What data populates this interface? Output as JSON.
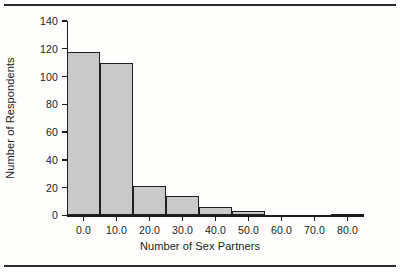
{
  "chart_data": {
    "type": "bar",
    "title": "",
    "xlabel": "Number of Sex Partners",
    "ylabel": "Number of Respondents",
    "categories": [
      "0.0",
      "10.0",
      "20.0",
      "30.0",
      "40.0",
      "50.0",
      "60.0",
      "70.0",
      "80.0"
    ],
    "values": [
      118,
      110,
      21,
      14,
      6,
      3,
      0,
      0,
      1
    ],
    "xtick_labels": [
      "0.0",
      "10.0",
      "20.0",
      "30.0",
      "40.0",
      "50.0",
      "60.0",
      "70.0",
      "80.0"
    ],
    "xtick_values": [
      0,
      10,
      20,
      30,
      40,
      50,
      60,
      70,
      80
    ],
    "ytick_labels": [
      "0",
      "20",
      "40",
      "60",
      "80",
      "100",
      "120",
      "140"
    ],
    "ytick_values": [
      0,
      20,
      40,
      60,
      80,
      100,
      120,
      140
    ],
    "ylim": [
      0,
      140
    ],
    "xlim": [
      -5,
      85
    ],
    "bin_width": 10,
    "grid": false,
    "legend": false,
    "bar_fill_color": "#c9c9c9",
    "bar_edge_color": "#1f1f1f",
    "axis_color": "#1c1c1c",
    "background_color": "#fdfdfc"
  },
  "figure": {
    "top_rule": "",
    "bottom_rule": ""
  }
}
